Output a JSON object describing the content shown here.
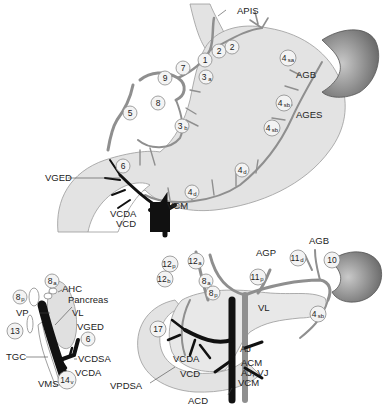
{
  "figure": {
    "panels": [
      {
        "id": "stomach",
        "labels": {
          "apis": "APIS",
          "agb": "AGB",
          "ages": "AGES",
          "vged": "VGED",
          "vcm": "VCM",
          "vcda": "VCDA",
          "vcd": "VCD"
        },
        "nodes": [
          {
            "id": "n1",
            "main": "1",
            "sub": ""
          },
          {
            "id": "n2a",
            "main": "2",
            "sub": ""
          },
          {
            "id": "n2b",
            "main": "2",
            "sub": ""
          },
          {
            "id": "n3a",
            "main": "3",
            "sub": "a"
          },
          {
            "id": "n3b",
            "main": "3",
            "sub": "b"
          },
          {
            "id": "n4sa",
            "main": "4",
            "sub": "sa"
          },
          {
            "id": "n4sb1",
            "main": "4",
            "sub": "sb"
          },
          {
            "id": "n4sb2",
            "main": "4",
            "sub": "sb"
          },
          {
            "id": "n4d1",
            "main": "4",
            "sub": "d"
          },
          {
            "id": "n4d2",
            "main": "4",
            "sub": "d"
          },
          {
            "id": "n5",
            "main": "5",
            "sub": ""
          },
          {
            "id": "n6",
            "main": "6",
            "sub": ""
          },
          {
            "id": "n7",
            "main": "7",
            "sub": ""
          },
          {
            "id": "n8",
            "main": "8",
            "sub": ""
          },
          {
            "id": "n9",
            "main": "9",
            "sub": ""
          }
        ]
      },
      {
        "id": "pancreas-lateral",
        "labels": {
          "ahc": "AHC",
          "pancreas": "Pancreas",
          "vp": "VP",
          "vl": "VL",
          "vged": "VGED",
          "tgc": "TGC",
          "vcdsa": "VCDSA",
          "vcda": "VCDA",
          "vms": "VMS"
        },
        "nodes": [
          {
            "id": "n8a",
            "main": "8",
            "sub": "a"
          },
          {
            "id": "n8p",
            "main": "8",
            "sub": "p"
          },
          {
            "id": "n13",
            "main": "13",
            "sub": ""
          },
          {
            "id": "n6",
            "main": "6",
            "sub": ""
          },
          {
            "id": "n14v",
            "main": "14",
            "sub": "v"
          }
        ]
      },
      {
        "id": "pancreas-frontal",
        "labels": {
          "agp": "AGP",
          "agb": "AGB",
          "vl": "VL",
          "vpdsa": "VPDSA",
          "vcda": "VCDA",
          "vcd": "VCD",
          "acd": "ACD",
          "aj": "AJ",
          "acm": "ACM",
          "ajvj": "AJ, VJ",
          "vcm": "VCM"
        },
        "nodes": [
          {
            "id": "n12a",
            "main": "12",
            "sub": "a"
          },
          {
            "id": "n12p",
            "main": "12",
            "sub": "p"
          },
          {
            "id": "n12b",
            "main": "12",
            "sub": "b"
          },
          {
            "id": "n8a",
            "main": "8",
            "sub": "a"
          },
          {
            "id": "n8p",
            "main": "8",
            "sub": "p"
          },
          {
            "id": "n11p",
            "main": "11",
            "sub": "p"
          },
          {
            "id": "n11d",
            "main": "11",
            "sub": "d"
          },
          {
            "id": "n10",
            "main": "10",
            "sub": ""
          },
          {
            "id": "n4sb",
            "main": "4",
            "sub": "sb"
          },
          {
            "id": "n17",
            "main": "17",
            "sub": ""
          }
        ]
      }
    ]
  },
  "colors": {
    "organ_fill": "#e3e3e3",
    "spleen": "#7a7a7a",
    "artery": "#8f8f8f",
    "vein": "#111111",
    "node_circle": "#f3f3f3"
  }
}
